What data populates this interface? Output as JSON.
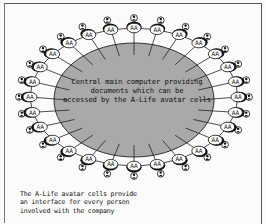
{
  "diagram": {
    "central_node": {
      "lines": [
        "Central main computer providing",
        "documents which can be",
        "accessed by the A-Life avatar cells"
      ],
      "fill": "#a9a9a9",
      "center": [
        134,
        100
      ],
      "rx": 80,
      "ry": 57
    },
    "ring": {
      "center": [
        134,
        97
      ],
      "rx": 104,
      "ry": 69,
      "node_count": 28,
      "node_label": "AA",
      "person_icon": "person-icon"
    },
    "caption": {
      "lines": [
        "The A-Life avatar cells provide",
        "an interface for every person",
        "involved with the company"
      ]
    },
    "colors": {
      "background": "#fbfbfb",
      "line": "#222222",
      "node_fill": "#ffffff",
      "node_dark": "#111111"
    }
  }
}
